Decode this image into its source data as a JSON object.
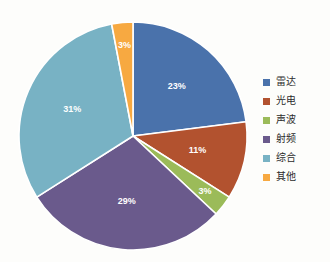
{
  "chart_data": {
    "type": "pie",
    "title": "",
    "categories": [
      "雷达",
      "光电",
      "声波",
      "射频",
      "综合",
      "其他"
    ],
    "values": [
      23,
      11,
      3,
      29,
      31,
      3
    ],
    "value_unit": "%",
    "data_labels": [
      "23%",
      "11%",
      "3%",
      "29%",
      "31%",
      "3%"
    ],
    "colors": [
      "#4a72ab",
      "#b2522f",
      "#9bbb59",
      "#6a5a8c",
      "#78b2c4",
      "#f5a githubusercontent"
    ],
    "start_angle_deg": 0,
    "direction": "clockwise",
    "legend_position": "right",
    "grid": false,
    "xlabel": "",
    "ylabel": ""
  },
  "palette": {
    "radar": "#4a72ab",
    "electro_optical": "#b2522f",
    "acoustic": "#9bbb59",
    "rf": "#6a5a8c",
    "integrated": "#78b2c4",
    "other": "#f7a941",
    "separator": "#ffffff",
    "label_text": "#ffffff",
    "legend_text": "#2b2b2b",
    "background": "#fdfdfb"
  },
  "legend": {
    "items": [
      {
        "label": "雷达",
        "color": "#4a72ab"
      },
      {
        "label": "光电",
        "color": "#b2522f"
      },
      {
        "label": "声波",
        "color": "#9bbb59"
      },
      {
        "label": "射频",
        "color": "#6a5a8c"
      },
      {
        "label": "综合",
        "color": "#78b2c4"
      },
      {
        "label": "其他",
        "color": "#f7a941"
      }
    ]
  },
  "slices": [
    {
      "name": "雷达",
      "label": "23%",
      "value": 23,
      "color": "#4a72ab"
    },
    {
      "name": "光电",
      "label": "11%",
      "value": 11,
      "color": "#b2522f"
    },
    {
      "name": "声波",
      "label": "3%",
      "value": 3,
      "color": "#9bbb59"
    },
    {
      "name": "射频",
      "label": "29%",
      "value": 29,
      "color": "#6a5a8c"
    },
    {
      "name": "综合",
      "label": "31%",
      "value": 31,
      "color": "#78b2c4"
    },
    {
      "name": "其他",
      "label": "3%",
      "value": 3,
      "color": "#f7a941"
    }
  ]
}
